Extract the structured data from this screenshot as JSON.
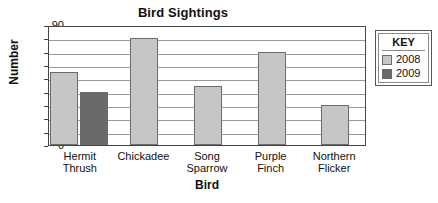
{
  "chart_data": {
    "type": "bar",
    "title": "Bird Sightings",
    "xlabel": "Bird",
    "ylabel": "Number",
    "categories": [
      "Hermit Thrush",
      "Chickadee",
      "Song Sparrow",
      "Purple Finch",
      "Northern Flicker"
    ],
    "category_lines": [
      [
        "Hermit",
        "Thrush"
      ],
      [
        "Chickadee",
        ""
      ],
      [
        "Song",
        "Sparrow"
      ],
      [
        "Purple",
        "Finch"
      ],
      [
        "Northern",
        "Flicker"
      ]
    ],
    "series": [
      {
        "name": "2008",
        "color": "#c6c6c6",
        "values": [
          55,
          80,
          44,
          70,
          30
        ]
      },
      {
        "name": "2009",
        "color": "#696969",
        "values": [
          40,
          null,
          null,
          null,
          null
        ]
      }
    ],
    "ylim": [
      0,
      90
    ],
    "yticks": [
      90,
      80,
      70,
      60,
      50,
      40,
      30,
      20,
      10,
      0
    ],
    "ytick_labels": [
      "90",
      "80",
      "70",
      "60",
      "50",
      "40",
      "30",
      "20",
      "10",
      "0"
    ],
    "grid": true,
    "legend_position": "right",
    "legend_title": "KEY"
  }
}
